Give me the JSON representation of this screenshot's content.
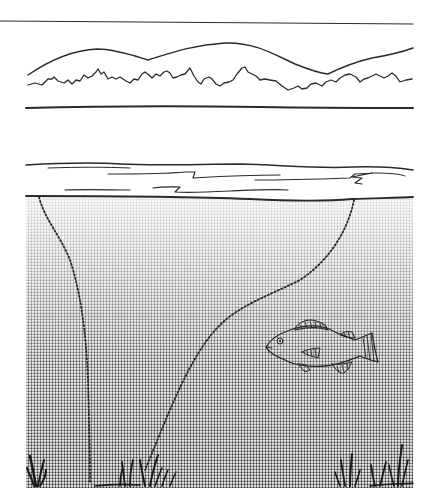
{
  "illustration": {
    "subject": "lake cross-section with fish",
    "colors": {
      "ink": "#2a2a2a",
      "background": "#ffffff",
      "water_top": "#ececec",
      "water_bottom": "#9a9a9a"
    },
    "elements": [
      {
        "name": "horizon-rule"
      },
      {
        "name": "distant-hills"
      },
      {
        "name": "treeline"
      },
      {
        "name": "far-shore-line"
      },
      {
        "name": "surface-layer"
      },
      {
        "name": "water-body"
      },
      {
        "name": "dotted-line-left"
      },
      {
        "name": "dotted-line-right"
      },
      {
        "name": "fish"
      },
      {
        "name": "weeds-left"
      },
      {
        "name": "weeds-center"
      },
      {
        "name": "weeds-right"
      }
    ]
  }
}
